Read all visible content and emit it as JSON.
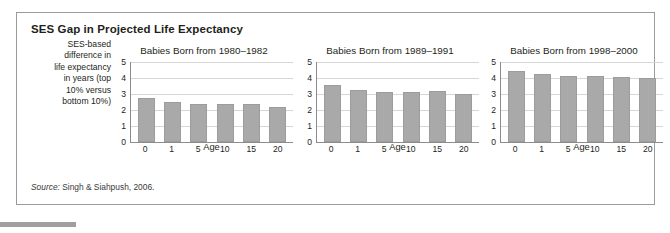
{
  "figure": {
    "title": "SES Gap in Projected Life Expectancy",
    "y_axis_caption_lines": [
      "SES-based",
      "difference in",
      "life expectancy",
      "in years (top",
      "10% versus",
      "bottom 10%)"
    ],
    "source_label": "Source:",
    "source_text": " Singh & Siahpush, 2006."
  },
  "colors": {
    "bar_fill": "#a9a9a9",
    "bar_stroke": "#9c9c9c",
    "gridline": "#d6d6d6",
    "axis": "#8c8c8c",
    "frame": "#9b9b9b",
    "text": "#231f20"
  },
  "chart_data": [
    {
      "type": "bar",
      "title": "Babies Born from 1980–1982",
      "categories": [
        "0",
        "1",
        "5",
        "10",
        "15",
        "20"
      ],
      "values": [
        2.75,
        2.5,
        2.4,
        2.4,
        2.4,
        2.2
      ],
      "xlabel": "Age",
      "ylabel": "SES-based difference in life expectancy in years (top 10% versus bottom 10%)",
      "ylim": [
        0,
        5
      ],
      "yticks": [
        "5",
        "4",
        "3",
        "2",
        "1",
        "0"
      ],
      "grid": true,
      "legend": "none"
    },
    {
      "type": "bar",
      "title": "Babies Born from 1989–1991",
      "categories": [
        "0",
        "1",
        "5",
        "10",
        "15",
        "20"
      ],
      "values": [
        3.55,
        3.25,
        3.15,
        3.15,
        3.2,
        3.0
      ],
      "xlabel": "Age",
      "ylabel": "SES-based difference in life expectancy in years (top 10% versus bottom 10%)",
      "ylim": [
        0,
        5
      ],
      "yticks": [
        "5",
        "4",
        "3",
        "2",
        "1",
        "0"
      ],
      "grid": true,
      "legend": "none"
    },
    {
      "type": "bar",
      "title": "Babies Born from 1998–2000",
      "categories": [
        "0",
        "1",
        "5",
        "10",
        "15",
        "20"
      ],
      "values": [
        4.45,
        4.25,
        4.15,
        4.15,
        4.05,
        4.0
      ],
      "xlabel": "Age",
      "ylabel": "SES-based difference in life expectancy in years (top 10% versus bottom 10%)",
      "ylim": [
        0,
        5
      ],
      "yticks": [
        "5",
        "4",
        "3",
        "2",
        "1",
        "0"
      ],
      "grid": true,
      "legend": "none"
    }
  ]
}
